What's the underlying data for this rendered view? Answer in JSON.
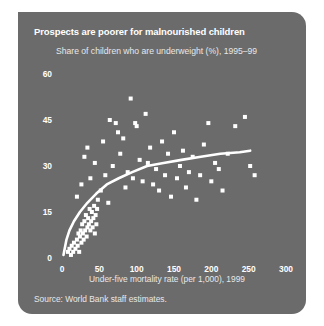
{
  "figure": {
    "title": "Prospects are poorer for malnourished children",
    "subtitle": "Share of children who are underweight (%), 1995–99",
    "source": "Source: World Bank staff estimates.",
    "panel_color": "#6b6b6b",
    "marker_color": "#ffffff",
    "text_color": "#ffffff",
    "trend_color": "#ffffff"
  },
  "chart_data": {
    "type": "scatter",
    "title": "Prospects are poorer for malnourished children",
    "subtitle": "Share of children who are underweight (%), 1995–99",
    "xlabel": "Under-five mortality rate (per 1,000), 1999",
    "ylabel": "Share of children who are underweight (%), 1995–99",
    "xlim": [
      0,
      300
    ],
    "ylim": [
      0,
      60
    ],
    "xticks": [
      0,
      50,
      100,
      150,
      200,
      250,
      300
    ],
    "yticks": [
      0,
      15,
      30,
      45,
      60
    ],
    "grid": false,
    "legend": "none",
    "marker": "square",
    "points": [
      [
        8,
        2
      ],
      [
        10,
        3
      ],
      [
        12,
        1
      ],
      [
        13,
        4
      ],
      [
        15,
        2
      ],
      [
        16,
        5
      ],
      [
        18,
        3
      ],
      [
        20,
        6
      ],
      [
        21,
        4
      ],
      [
        22,
        8
      ],
      [
        23,
        2
      ],
      [
        24,
        7
      ],
      [
        25,
        9
      ],
      [
        26,
        5
      ],
      [
        27,
        11
      ],
      [
        28,
        8
      ],
      [
        29,
        6
      ],
      [
        30,
        12
      ],
      [
        31,
        9
      ],
      [
        32,
        14
      ],
      [
        33,
        7
      ],
      [
        34,
        10
      ],
      [
        35,
        13
      ],
      [
        36,
        11
      ],
      [
        37,
        16
      ],
      [
        38,
        9
      ],
      [
        39,
        12
      ],
      [
        40,
        15
      ],
      [
        41,
        10
      ],
      [
        42,
        13
      ],
      [
        43,
        17
      ],
      [
        44,
        8
      ],
      [
        45,
        14
      ],
      [
        46,
        11
      ],
      [
        47,
        16
      ],
      [
        20,
        20
      ],
      [
        26,
        24
      ],
      [
        30,
        33
      ],
      [
        34,
        36
      ],
      [
        38,
        26
      ],
      [
        44,
        31
      ],
      [
        48,
        19
      ],
      [
        52,
        22
      ],
      [
        55,
        38
      ],
      [
        58,
        27
      ],
      [
        62,
        18
      ],
      [
        64,
        45
      ],
      [
        68,
        30
      ],
      [
        72,
        44
      ],
      [
        75,
        41
      ],
      [
        78,
        34
      ],
      [
        82,
        39
      ],
      [
        85,
        23
      ],
      [
        88,
        28
      ],
      [
        92,
        52
      ],
      [
        95,
        26
      ],
      [
        98,
        44
      ],
      [
        100,
        43
      ],
      [
        104,
        32
      ],
      [
        108,
        25
      ],
      [
        112,
        47
      ],
      [
        115,
        31
      ],
      [
        118,
        36
      ],
      [
        122,
        24
      ],
      [
        126,
        29
      ],
      [
        130,
        22
      ],
      [
        134,
        38
      ],
      [
        138,
        27
      ],
      [
        142,
        34
      ],
      [
        146,
        20
      ],
      [
        150,
        41
      ],
      [
        154,
        26
      ],
      [
        158,
        30
      ],
      [
        162,
        35
      ],
      [
        166,
        23
      ],
      [
        170,
        28
      ],
      [
        175,
        33
      ],
      [
        180,
        19
      ],
      [
        185,
        27
      ],
      [
        190,
        37
      ],
      [
        196,
        44
      ],
      [
        200,
        25
      ],
      [
        205,
        31
      ],
      [
        210,
        29
      ],
      [
        215,
        22
      ],
      [
        222,
        34
      ],
      [
        232,
        43
      ],
      [
        245,
        46
      ],
      [
        252,
        30
      ],
      [
        258,
        27
      ]
    ],
    "trend_curve": {
      "description": "Fitted logarithmic trend rising steeply then flattening",
      "points": [
        [
          2,
          1
        ],
        [
          6,
          6
        ],
        [
          10,
          9
        ],
        [
          16,
          12
        ],
        [
          24,
          15
        ],
        [
          34,
          18
        ],
        [
          46,
          21
        ],
        [
          60,
          24
        ],
        [
          76,
          26
        ],
        [
          94,
          28
        ],
        [
          114,
          30
        ],
        [
          136,
          31
        ],
        [
          160,
          32
        ],
        [
          186,
          33
        ],
        [
          212,
          34
        ],
        [
          238,
          34.5
        ],
        [
          252,
          35
        ]
      ]
    }
  },
  "axis": {
    "x_tick_labels": [
      "0",
      "50",
      "100",
      "150",
      "200",
      "250",
      "300"
    ],
    "y_tick_labels": [
      "0",
      "15",
      "30",
      "45",
      "60"
    ],
    "x_title": "Under-five mortality rate (per 1,000), 1999"
  }
}
